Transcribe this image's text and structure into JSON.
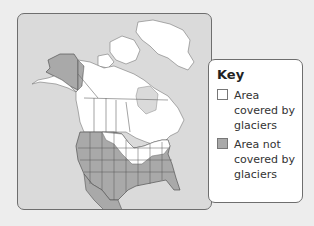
{
  "map": {
    "title": "North America glacier coverage map",
    "colors": {
      "background": "#ededed",
      "water": "#dadada",
      "glaciated_land": "#ffffff",
      "unglaciated_land": "#a9a9a9",
      "border": "#555555"
    }
  },
  "key": {
    "title": "Key",
    "items": [
      {
        "label": "Area covered by glaciers",
        "swatch": "#ffffff"
      },
      {
        "label": "Area not covered by glaciers",
        "swatch": "#a9a9a9"
      }
    ]
  }
}
